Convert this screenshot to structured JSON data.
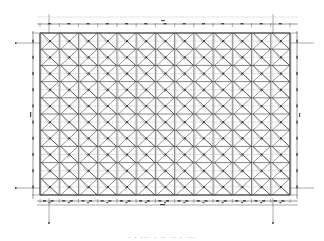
{
  "drawing": {
    "type": "structural-plan",
    "description": "Steel space-frame / grid plan with X-bracing in every bay",
    "grid": {
      "columns": 13,
      "rows": 10,
      "left": 40,
      "top": 33,
      "right": 290,
      "bottom": 195
    },
    "line_color": "#333333",
    "light_line_color": "#8a8a8a",
    "dimension_top_label": "",
    "dimension_bottom_label": "",
    "caption": "· · ··· · ·· ·· · ···"
  },
  "colors": {
    "background": "#ffffff",
    "ink": "#333333",
    "dimension": "#555555"
  }
}
